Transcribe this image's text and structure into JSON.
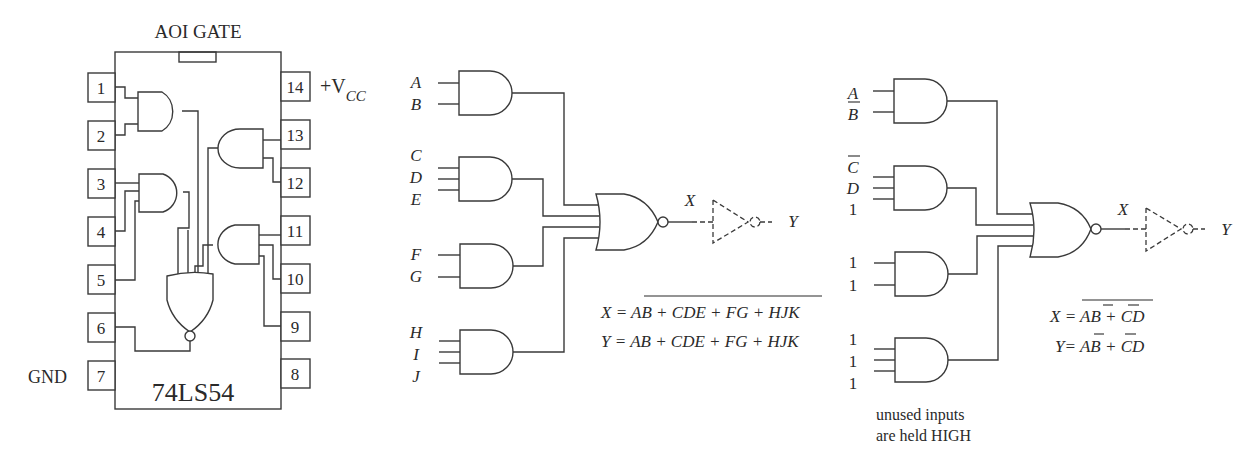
{
  "ic": {
    "title": "AOI GATE",
    "part_number": "74LS54",
    "vcc_label": "+V",
    "vcc_subscript": "CC",
    "gnd_label": "GND",
    "pins_left": [
      "1",
      "2",
      "3",
      "4",
      "5",
      "6",
      "7"
    ],
    "pins_right": [
      "14",
      "13",
      "12",
      "11",
      "10",
      "9",
      "8"
    ]
  },
  "middle_circuit": {
    "inputs": {
      "gate1": [
        "A",
        "B"
      ],
      "gate2": [
        "C",
        "D",
        "E"
      ],
      "gate3": [
        "F",
        "G"
      ],
      "gate4": [
        "H",
        "I",
        "J"
      ]
    },
    "output_x": "X",
    "output_y": "Y",
    "equation_x": {
      "lhs": "X = ",
      "rhs": "AB + CDE + FG + HJK",
      "rhs_overlined": true
    },
    "equation_y": {
      "lhs": "Y = ",
      "rhs": "AB + CDE + FG + HJK"
    }
  },
  "right_circuit": {
    "inputs": {
      "gate1": [
        {
          "label": "A",
          "complemented": false
        },
        {
          "label": "B",
          "complemented": true
        }
      ],
      "gate2": [
        {
          "label": "C",
          "complemented": true
        },
        {
          "label": "D",
          "complemented": false
        },
        {
          "label": "1",
          "complemented": false
        }
      ],
      "gate3": [
        {
          "label": "1",
          "complemented": false
        },
        {
          "label": "1",
          "complemented": false
        }
      ],
      "gate4": [
        {
          "label": "1",
          "complemented": false
        },
        {
          "label": "1",
          "complemented": false
        },
        {
          "label": "1",
          "complemented": false
        }
      ]
    },
    "output_x": "X",
    "output_y": "Y",
    "equation_x": {
      "lhs": "X = ",
      "terms": [
        "A",
        "B",
        " + ",
        "C",
        "D"
      ],
      "whole_rhs_overlined": true
    },
    "equation_y": {
      "lhs": "Y= ",
      "terms": [
        "A",
        "B",
        " + ",
        "C",
        "D"
      ]
    },
    "note_line1": "unused inputs",
    "note_line2": "are held HIGH"
  }
}
